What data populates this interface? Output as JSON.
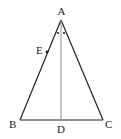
{
  "diagram": {
    "type": "geometry-triangle",
    "points": {
      "A": {
        "label": "A",
        "x": 61,
        "y": 20
      },
      "B": {
        "label": "B",
        "x": 20,
        "y": 120
      },
      "C": {
        "label": "C",
        "x": 103,
        "y": 120
      },
      "D": {
        "label": "D",
        "x": 61,
        "y": 120
      },
      "E": {
        "label": "E",
        "x": 47,
        "y": 52
      }
    },
    "segments": [
      {
        "from": "A",
        "to": "B"
      },
      {
        "from": "A",
        "to": "C"
      },
      {
        "from": "B",
        "to": "C"
      },
      {
        "from": "A",
        "to": "D"
      }
    ],
    "angle_marks": "two equal-angle dots at A (AD bisects angle BAC)",
    "colors": {
      "line": "#222222",
      "altitude": "#888888"
    }
  }
}
